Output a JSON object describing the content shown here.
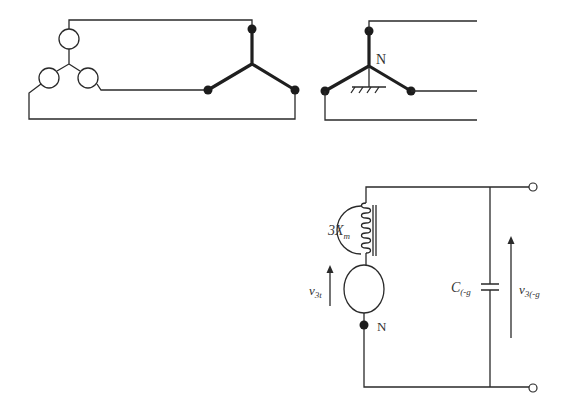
{
  "diagram": {
    "top": {
      "generator_star": {
        "phases": 3,
        "element": "voltage-source"
      },
      "load_star_left": {
        "arms": 3
      },
      "load_star_right": {
        "arms": 3,
        "neutral_label": "N",
        "grounded": true
      }
    },
    "bottom": {
      "inductor_label": {
        "main": "3X",
        "sub": "m"
      },
      "source_voltage_label": {
        "main": "v",
        "sub": "3t"
      },
      "neutral_label": "N",
      "capacitor_label": {
        "main": "C",
        "sub": "(-g"
      },
      "output_voltage_label": {
        "main": "v",
        "sub": "3(-g"
      }
    },
    "colors": {
      "line": "#2a2a2a",
      "node": "#1c1c1c",
      "text": "#333333"
    }
  }
}
